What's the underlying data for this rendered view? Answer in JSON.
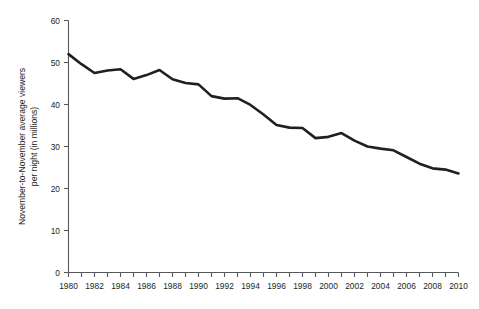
{
  "chart_data": {
    "type": "line",
    "title": "",
    "xlabel": "",
    "ylabel": "November-to-November average viewers per night  (in millions)",
    "ylabel_line1": "November-to-November average viewers",
    "ylabel_line2": "per night  (in millions)",
    "xlim": [
      1980,
      2010
    ],
    "ylim": [
      0,
      60
    ],
    "ytick_labels": [
      "0",
      "10",
      "20",
      "30",
      "40",
      "50",
      "60"
    ],
    "ytick_values": [
      0,
      10,
      20,
      30,
      40,
      50,
      60
    ],
    "xtick_values": [
      1980,
      1981,
      1982,
      1983,
      1984,
      1985,
      1986,
      1987,
      1988,
      1989,
      1990,
      1991,
      1992,
      1993,
      1994,
      1995,
      1996,
      1997,
      1998,
      1999,
      2000,
      2001,
      2002,
      2003,
      2004,
      2005,
      2006,
      2007,
      2008,
      2009,
      2010
    ],
    "xtick_labels_shown": [
      "1980",
      "1982",
      "1984",
      "1986",
      "1988",
      "1990",
      "1992",
      "1994",
      "1996",
      "1998",
      "2000",
      "2002",
      "2004",
      "2006",
      "2008",
      "2010"
    ],
    "grid": false,
    "legend": null,
    "line_color": "#231f20",
    "axis_color": "#58595b",
    "x": [
      1980,
      1981,
      1982,
      1983,
      1984,
      1985,
      1986,
      1987,
      1988,
      1989,
      1990,
      1991,
      1992,
      1993,
      1994,
      1995,
      1996,
      1997,
      1998,
      1999,
      2000,
      2001,
      2002,
      2003,
      2004,
      2005,
      2006,
      2007,
      2008,
      2009,
      2010
    ],
    "values": [
      52.0,
      49.6,
      47.5,
      48.1,
      48.4,
      46.1,
      47.0,
      48.2,
      46.0,
      45.1,
      44.8,
      42.0,
      41.4,
      41.5,
      39.9,
      37.6,
      35.1,
      34.5,
      34.4,
      32.0,
      32.3,
      33.2,
      31.4,
      30.0,
      29.5,
      29.1,
      27.5,
      25.9,
      24.8,
      24.5,
      23.6
    ]
  }
}
